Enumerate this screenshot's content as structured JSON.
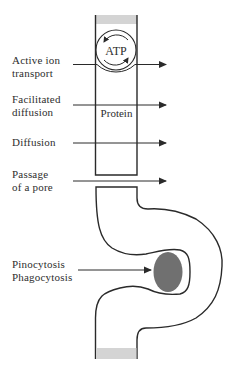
{
  "diagram": {
    "labels": {
      "active_ion_transport": {
        "line1": "Active ion",
        "line2": "transport"
      },
      "facilitated_diffusion": {
        "line1": "Facilitated",
        "line2": "diffusion"
      },
      "diffusion": {
        "line1": "Diffusion"
      },
      "passage_of_pore": {
        "line1": "Passage",
        "line2": "of a pore"
      },
      "endocytosis": {
        "line1": "Pinocytosis",
        "line2": "Phagocytosis"
      }
    },
    "inner_labels": {
      "atp": "ATP",
      "protein": "Protein"
    },
    "colors": {
      "stroke": "#2a2a2a",
      "membrane_band": "#d4d4d4",
      "vesicle_fill": "#707070",
      "background": "#ffffff"
    }
  }
}
